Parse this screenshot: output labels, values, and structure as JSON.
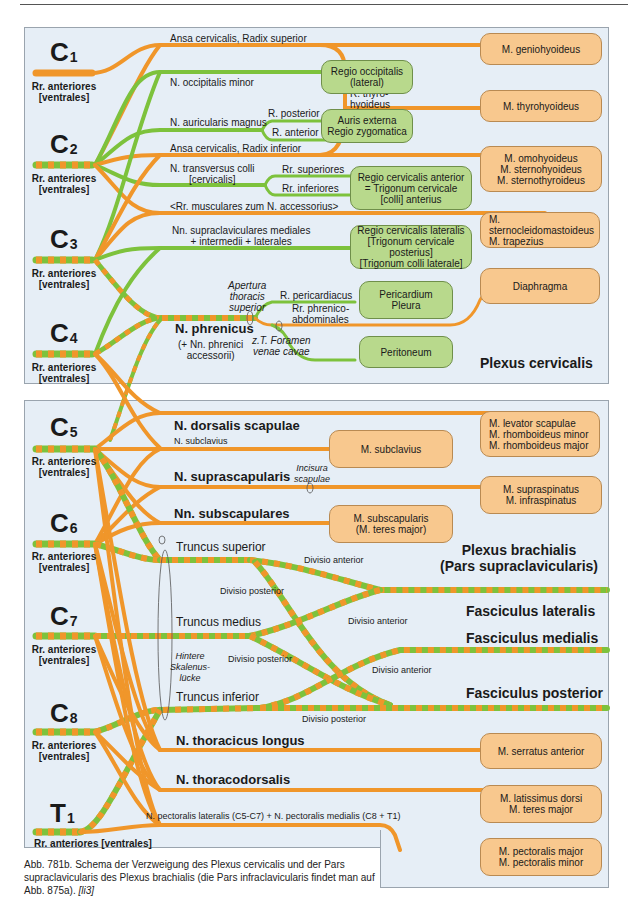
{
  "figure": {
    "caption": "Abb. 781b. Schema der Verzweigung des Plexus cervicalis und der Pars supraclavicularis des Plexus brachialis (die Pars infraclavicularis findet man auf Abb. 875a).",
    "caption_ref": "[li3]",
    "colors": {
      "motor_orange": "#f0962a",
      "sensory_green": "#7dc23c",
      "panel_bg": "#e6eef6",
      "muscle_box": "#f8c88e",
      "region_box": "#b8d98c"
    }
  },
  "plexus_cervicalis": {
    "title": "Plexus cervicalis",
    "roots": [
      {
        "name": "C",
        "num": "1",
        "label": "Rr. anteriores\n[ventrales]"
      },
      {
        "name": "C",
        "num": "2",
        "label": "Rr. anteriores\n[ventrales]"
      },
      {
        "name": "C",
        "num": "3",
        "label": "Rr. anteriores\n[ventrales]"
      },
      {
        "name": "C",
        "num": "4",
        "label": "Rr. anteriores\n[ventrales]"
      }
    ],
    "nerves": {
      "ansa_sup": "Ansa cervicalis, Radix superior",
      "occ_minor": "N. occipitalis minor",
      "aur_magnus": "N. auricularis magnus",
      "r_posterior": "R. posterior",
      "r_anterior": "R. anterior",
      "ansa_inf": "Ansa cervicalis, Radix inferior",
      "transversus": "N. transversus colli\n[cervicalis]",
      "rr_sup": "Rr. superiores",
      "rr_inf": "Rr. inferiores",
      "rr_musc": "<Rr. musculares zum N. accessorius>",
      "supraclav": "Nn. supraclaviculares mediales\n+ intermedii + laterales",
      "thyro": "R. thyro-\nhyoideus",
      "phrenicus": "N. phrenicus",
      "phrenicus_acc": "(+ Nn. phrenici\naccessorii)",
      "apertura": "Apertura\nthoracis\nsuperior",
      "r_pericard": "R. pericardiacus",
      "rr_phrenico": "Rr. phrenico-\nabdominales",
      "foramen": "z.T. Foramen\nvenae cavae"
    },
    "region_boxes": [
      "Regio occipitalis\n(lateral)",
      "Auris externa\nRegio zygomatica",
      "Regio cervicalis anterior\n= Trigonum cervicale\n[colli] anterius",
      "Regio cervicalis lateralis\n[Trigonum cervicale posterius]\n[Trigonum colli laterale]",
      "Pericardium\nPleura",
      "Peritoneum"
    ],
    "muscle_boxes": [
      "M. geniohyoideus",
      "M. thyrohyoideus",
      "M. omohyoideus\nM. sternohyoideus\nM. sternothyroideus",
      "M. sternocleidomastoideus\nM. trapezius",
      "Diaphragma"
    ]
  },
  "plexus_brachialis": {
    "title": "Plexus brachialis\n(Pars supraclavicularis)",
    "roots": [
      {
        "name": "C",
        "num": "5",
        "label": "Rr. anteriores\n[ventrales]"
      },
      {
        "name": "C",
        "num": "6",
        "label": "Rr. anteriores\n[ventrales]"
      },
      {
        "name": "C",
        "num": "7",
        "label": "Rr. anteriores\n[ventrales]"
      },
      {
        "name": "C",
        "num": "8",
        "label": "Rr. anteriores\n[ventrales]"
      },
      {
        "name": "T",
        "num": "1",
        "label": "Rr. anteriores [ventrales]"
      }
    ],
    "nerves": {
      "dorsalis_scap": "N. dorsalis scapulae",
      "subclavius": "N. subclavius",
      "suprascap": "N. suprascapularis",
      "incisura": "Incisura\nscapulae",
      "subscap": "Nn. subscapulares",
      "truncus_sup": "Truncus superior",
      "truncus_med": "Truncus medius",
      "truncus_inf": "Truncus inferior",
      "hintere": "Hintere\nSkalenus-\nlücke",
      "div_ant_1": "Divisio anterior",
      "div_post_1": "Divisio posterior",
      "div_ant_2": "Divisio anterior",
      "div_post_2": "Divisio posterior",
      "div_ant_3": "Divisio anterior",
      "div_post_3": "Divisio posterior",
      "thor_longus": "N. thoracicus longus",
      "thoracodors": "N. thoracodorsalis",
      "pectoralis": "N. pectoralis lateralis (C5-C7) + N. pectoralis medialis (C8 + T1)"
    },
    "fasciculi": [
      "Fasciculus lateralis",
      "Fasciculus medialis",
      "Fasciculus posterior"
    ],
    "muscle_boxes": [
      "M. levator scapulae\nM. rhomboideus minor\nM. rhomboideus major",
      "M. subclavius",
      "M. supraspinatus\nM. infraspinatus",
      "M. subscapularis\n(M. teres major)",
      "M. serratus anterior",
      "M. latissimus dorsi\nM. teres major",
      "M. pectoralis major\nM. pectoralis minor"
    ]
  }
}
